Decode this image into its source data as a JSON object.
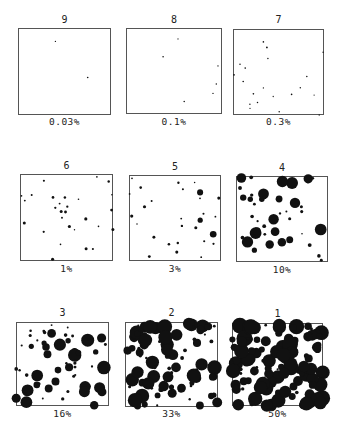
{
  "figure": {
    "panels": [
      {
        "id": "9",
        "label": "0.03%",
        "x": 18,
        "y": 28,
        "w": 93,
        "h": 87,
        "numY": 14,
        "pctY": 116,
        "seed": 9,
        "count": 2,
        "minR": 0.6,
        "maxR": 0.8,
        "bigFrac": 0
      },
      {
        "id": "8",
        "label": "0.1%",
        "x": 126,
        "y": 28,
        "w": 96,
        "h": 86,
        "numY": 14,
        "pctY": 116,
        "seed": 8,
        "count": 6,
        "minR": 0.6,
        "maxR": 0.8,
        "bigFrac": 0
      },
      {
        "id": "7",
        "label": "0.3%",
        "x": 233,
        "y": 29,
        "w": 91,
        "h": 86,
        "numY": 14,
        "pctY": 116,
        "seed": 7,
        "count": 20,
        "minR": 0.6,
        "maxR": 0.9,
        "bigFrac": 0
      },
      {
        "id": "6",
        "label": "1%",
        "x": 20,
        "y": 174,
        "w": 93,
        "h": 87,
        "numY": 160,
        "pctY": 263,
        "seed": 6,
        "count": 28,
        "minR": 0.7,
        "maxR": 1.6,
        "bigFrac": 0
      },
      {
        "id": "5",
        "label": "3%",
        "x": 129,
        "y": 175,
        "w": 92,
        "h": 86,
        "numY": 161,
        "pctY": 263,
        "seed": 5,
        "count": 28,
        "minR": 0.7,
        "maxR": 1.6,
        "bigFrac": 0.2
      },
      {
        "id": "4",
        "label": "10%",
        "x": 236,
        "y": 176,
        "w": 92,
        "h": 86,
        "numY": 162,
        "pctY": 264,
        "seed": 4,
        "count": 45,
        "minR": 0.8,
        "maxR": 2,
        "bigFrac": 0.45
      },
      {
        "id": "3",
        "label": "16%",
        "x": 16,
        "y": 322,
        "w": 93,
        "h": 84,
        "numY": 307,
        "pctY": 408,
        "seed": 3,
        "count": 60,
        "minR": 0.9,
        "maxR": 2,
        "bigFrac": 0.55
      },
      {
        "id": "2",
        "label": "33%",
        "x": 125,
        "y": 322,
        "w": 93,
        "h": 85,
        "numY": 307,
        "pctY": 408,
        "seed": 2,
        "count": 95,
        "minR": 1,
        "maxR": 2,
        "bigFrac": 0.7
      },
      {
        "id": "1",
        "label": "50%",
        "x": 232,
        "y": 323,
        "w": 91,
        "h": 83,
        "numY": 308,
        "pctY": 408,
        "seed": 1,
        "count": 130,
        "minR": 1,
        "maxR": 2,
        "bigFrac": 0.85
      }
    ],
    "colors": {
      "ink": "#111111",
      "border": "#555555",
      "paper": "#ffffff"
    }
  }
}
